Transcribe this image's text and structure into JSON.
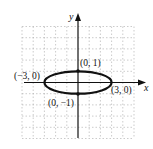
{
  "chart_data": {
    "type": "line",
    "title": "",
    "xlabel": "x",
    "ylabel": "y",
    "xlim": [
      -5,
      5
    ],
    "ylim": [
      -5,
      5
    ],
    "grid": true,
    "legend": null,
    "curve": {
      "kind": "ellipse",
      "center": [
        0,
        0
      ],
      "semi_major_x": 3,
      "semi_minor_y": 1,
      "equation": "x^2/9 + y^2 = 1"
    },
    "points": [
      {
        "x": 0,
        "y": 1,
        "label": "(0, 1)"
      },
      {
        "x": -3,
        "y": 0,
        "label": "(−3, 0)"
      },
      {
        "x": 3,
        "y": 0,
        "label": "(3, 0)"
      },
      {
        "x": 0,
        "y": -1,
        "label": "(0, −1)"
      }
    ],
    "colors": {
      "curve": "#111111",
      "axes": "#111111",
      "grid": "#9a9a9a"
    }
  },
  "labels": {
    "x_axis": "x",
    "y_axis": "y",
    "top": "(0, 1)",
    "left": "(−3, 0)",
    "right": "(3, 0)",
    "bottom": "(0, −1)"
  }
}
